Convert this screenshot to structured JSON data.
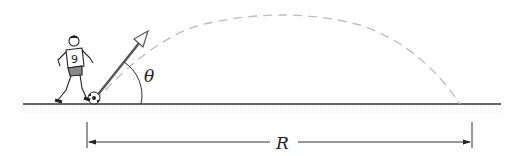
{
  "diagram": {
    "angle_label": "θ",
    "range_label": "R",
    "player_number": "9",
    "colors": {
      "ground": "#333333",
      "trajectory": "#bdbdbd",
      "vector": "#555555",
      "ink": "#222222"
    }
  }
}
